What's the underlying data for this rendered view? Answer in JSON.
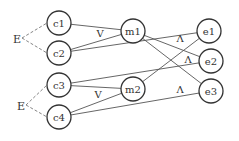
{
  "diagram": {
    "nodes": [
      {
        "id": "c1",
        "label": "c1",
        "x": 59,
        "y": 23
      },
      {
        "id": "c2",
        "label": "c2",
        "x": 59,
        "y": 53
      },
      {
        "id": "c3",
        "label": "c3",
        "x": 59,
        "y": 85
      },
      {
        "id": "c4",
        "label": "c4",
        "x": 59,
        "y": 117
      },
      {
        "id": "m1",
        "label": "m1",
        "x": 133,
        "y": 31
      },
      {
        "id": "m2",
        "label": "m2",
        "x": 133,
        "y": 89
      },
      {
        "id": "e1",
        "label": "e1",
        "x": 209,
        "y": 31
      },
      {
        "id": "e2",
        "label": "e2",
        "x": 211,
        "y": 61
      },
      {
        "id": "e3",
        "label": "e3",
        "x": 211,
        "y": 91
      }
    ],
    "edges": [
      [
        "c1",
        "m1"
      ],
      [
        "c2",
        "m1"
      ],
      [
        "c2",
        "e1"
      ],
      [
        "c3",
        "e2"
      ],
      [
        "c3",
        "m2"
      ],
      [
        "c4",
        "m2"
      ],
      [
        "c4",
        "e3"
      ],
      [
        "m1",
        "e2"
      ],
      [
        "m1",
        "e3"
      ],
      [
        "m2",
        "e1"
      ]
    ],
    "groups": [
      {
        "label": "E",
        "x": 17,
        "y": 40,
        "members": [
          "c1",
          "c2"
        ]
      },
      {
        "label": "E",
        "x": 21,
        "y": 107,
        "members": [
          "c3",
          "c4"
        ]
      }
    ],
    "operators": [
      {
        "symbol": "V",
        "x": 100,
        "y": 37
      },
      {
        "symbol": "V",
        "x": 98,
        "y": 98
      },
      {
        "symbol": "Λ",
        "x": 180,
        "y": 42
      },
      {
        "symbol": "Λ",
        "x": 188,
        "y": 63
      },
      {
        "symbol": "Λ",
        "x": 180,
        "y": 93
      }
    ]
  }
}
